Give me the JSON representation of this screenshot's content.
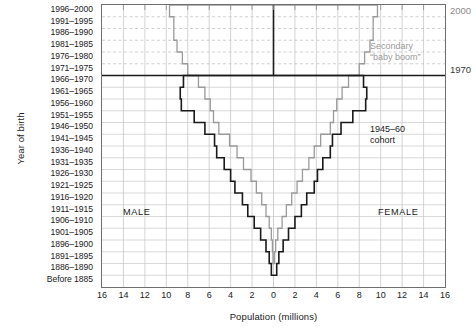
{
  "chart_data": {
    "type": "bar",
    "orientation": "population-pyramid",
    "title": "",
    "xlabel": "Population (millions)",
    "ylabel": "Year of birth",
    "xlim": [
      -16,
      16
    ],
    "xticks": [
      16,
      14,
      12,
      10,
      8,
      6,
      4,
      2,
      0,
      2,
      4,
      6,
      8,
      10,
      12,
      14,
      16
    ],
    "xtick_values": [
      -16,
      -14,
      -12,
      -10,
      -8,
      -6,
      -4,
      -2,
      0,
      2,
      4,
      6,
      8,
      10,
      12,
      14,
      16
    ],
    "grid": true,
    "legend": "none",
    "categories": [
      "1996–2000",
      "1991–1995",
      "1986–1990",
      "1981–1985",
      "1976–1980",
      "1971–1975",
      "1966–1970",
      "1961–1965",
      "1956–1960",
      "1951–1955",
      "1946–1950",
      "1941–1945",
      "1936–1940",
      "1931–1935",
      "1926–1930",
      "1921–1925",
      "1916–1920",
      "1911–1915",
      "1906–1910",
      "1901–1905",
      "1896–1900",
      "1891–1895",
      "1886–1890",
      "Before 1885"
    ],
    "series": [
      {
        "name": "2000 census",
        "color": "#9a9a9a",
        "male": [
          9.7,
          9.3,
          9.3,
          9.0,
          8.5,
          8.0,
          7.0,
          6.4,
          5.9,
          5.6,
          5.1,
          4.1,
          3.4,
          2.8,
          2.1,
          1.6,
          1.1,
          0.7,
          0.4,
          0.2,
          0.1,
          0.05,
          0.0,
          0.0
        ],
        "female": [
          9.7,
          9.3,
          9.3,
          9.0,
          8.5,
          8.0,
          7.0,
          6.4,
          5.9,
          5.6,
          5.3,
          4.4,
          3.8,
          3.3,
          2.7,
          2.2,
          1.7,
          1.2,
          0.8,
          0.4,
          0.2,
          0.1,
          0.0,
          0.0
        ]
      },
      {
        "name": "1970 census",
        "color": "#1a1a1a",
        "male": [
          0.0,
          0.0,
          0.0,
          0.0,
          0.0,
          0.0,
          8.4,
          8.7,
          8.6,
          7.4,
          6.4,
          5.5,
          5.3,
          4.6,
          4.0,
          3.6,
          2.9,
          2.4,
          1.8,
          1.2,
          0.7,
          0.4,
          0.2,
          0.0
        ],
        "female": [
          0.0,
          0.0,
          0.0,
          0.0,
          0.0,
          0.0,
          8.4,
          8.7,
          8.6,
          7.4,
          6.3,
          5.5,
          5.3,
          4.6,
          4.1,
          3.8,
          3.1,
          2.6,
          2.0,
          1.4,
          0.9,
          0.5,
          0.3,
          0.0
        ]
      }
    ],
    "reference_lines": [
      {
        "name": "1970",
        "category_index": 6,
        "label": "1970"
      },
      {
        "name": "2000",
        "category_index": 0,
        "label": "2000"
      }
    ],
    "annotations": [
      {
        "name": "secondary-baby-boom",
        "text_line1": "Secondary",
        "text_line2": "“baby boom”",
        "color": "#9a9a9a"
      },
      {
        "name": "1945-60-cohort",
        "text_line1": "1945–60",
        "text_line2": "cohort",
        "color": "#1a1a1a"
      },
      {
        "name": "male-label",
        "text": "MALE"
      },
      {
        "name": "female-label",
        "text": "FEMALE"
      }
    ]
  },
  "axes": {
    "y_title": "Year of birth",
    "x_title": "Population (millions)",
    "x_tick_labels": [
      "16",
      "14",
      "12",
      "10",
      "8",
      "6",
      "4",
      "2",
      "0",
      "2",
      "4",
      "6",
      "8",
      "10",
      "12",
      "14",
      "16"
    ],
    "band_labels": [
      "1996–2000",
      "1991–1995",
      "1986–1990",
      "1981–1985",
      "1976–1980",
      "1971–1975",
      "1966–1970",
      "1961–1965",
      "1956–1960",
      "1951–1955",
      "1946–1950",
      "1941–1945",
      "1936–1940",
      "1931–1935",
      "1926–1930",
      "1921–1925",
      "1916–1920",
      "1911–1915",
      "1906–1910",
      "1901–1905",
      "1896–1900",
      "1891–1895",
      "1886–1890",
      "Before 1885"
    ]
  },
  "labels": {
    "male": "MALE",
    "female": "FEMALE",
    "year_2000": "2000",
    "year_1970": "1970",
    "secondary_line1": "Secondary",
    "secondary_line2": "“baby boom”",
    "cohort_line1": "1945–60",
    "cohort_line2": "cohort"
  },
  "colors": {
    "gray_outline": "#9a9a9a",
    "black_outline": "#1a1a1a",
    "grid": "#c8c8c8",
    "frame": "#6e6e6e",
    "dashed_grid": "#bdbdbd"
  }
}
